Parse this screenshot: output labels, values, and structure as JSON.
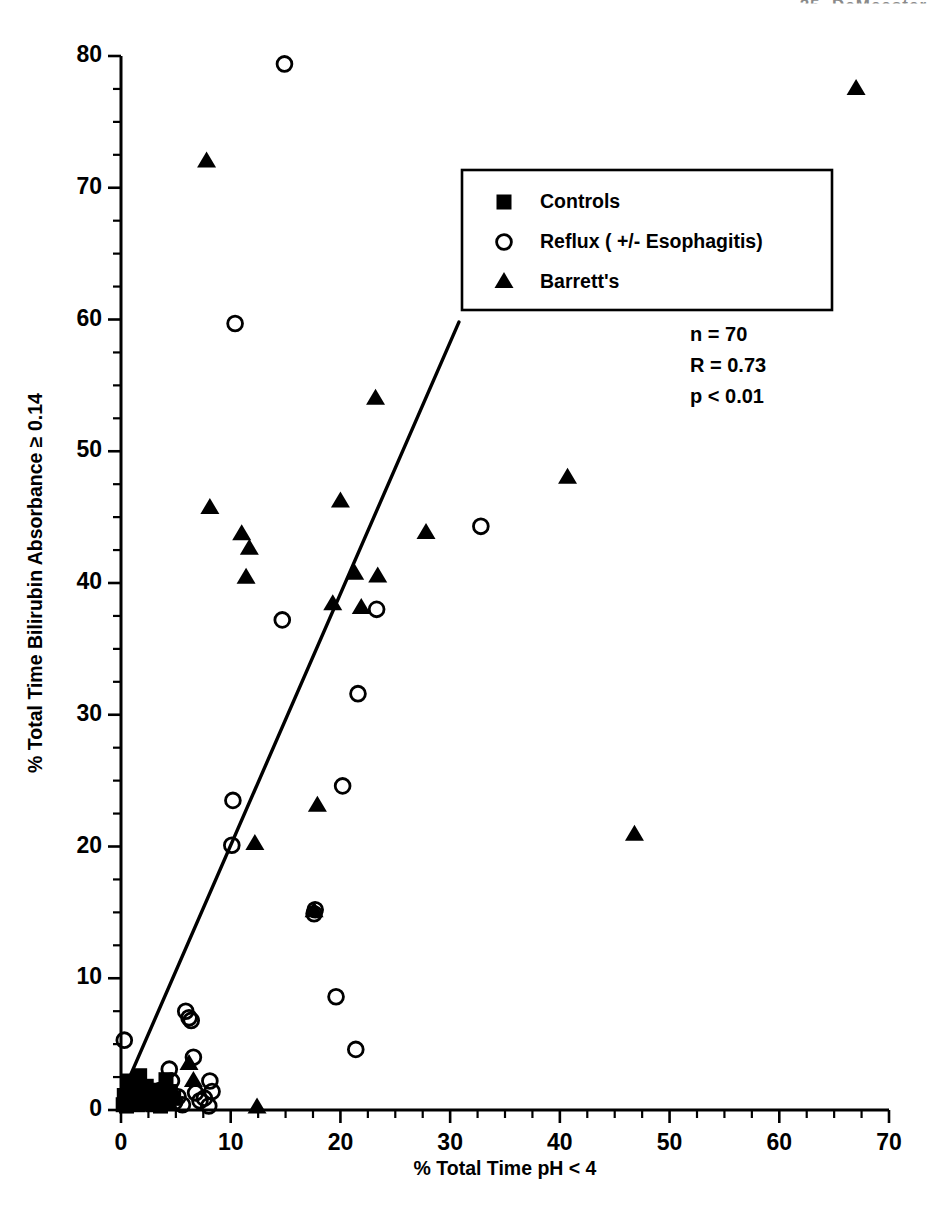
{
  "header": {
    "text": "25. DeMeester"
  },
  "chart_data": {
    "type": "scatter",
    "title": "",
    "xlabel": "% Total Time pH < 4",
    "ylabel": "% Total Time Bilirubin Absorbance ≥ 0.14",
    "xlim": [
      0,
      70
    ],
    "ylim": [
      0,
      80
    ],
    "xticks": [
      0,
      10,
      20,
      30,
      40,
      50,
      60,
      70
    ],
    "yticks": [
      0,
      10,
      20,
      30,
      40,
      50,
      60,
      70,
      80
    ],
    "x_minor_step": 2.5,
    "y_minor_step": 2.5,
    "grid": false,
    "legend_position": "top-center-right",
    "annotations": {
      "n": "n = 70",
      "r": "R = 0.73",
      "p": "p < 0.01"
    },
    "regression_line": {
      "x0": 0.0,
      "y0": 1.0,
      "x1": 30.8,
      "y1": 59.8
    },
    "series": [
      {
        "name": "Controls",
        "marker": "square",
        "points": [
          [
            0.2,
            0.4
          ],
          [
            0.3,
            1.1
          ],
          [
            0.5,
            0.3
          ],
          [
            0.6,
            2.2
          ],
          [
            0.8,
            1.3
          ],
          [
            0.9,
            0.5
          ],
          [
            1.1,
            2.0
          ],
          [
            1.2,
            0.8
          ],
          [
            1.4,
            1.6
          ],
          [
            1.5,
            0.4
          ],
          [
            1.7,
            2.6
          ],
          [
            1.9,
            1.0
          ],
          [
            2.1,
            0.5
          ],
          [
            2.3,
            1.8
          ],
          [
            2.5,
            0.7
          ],
          [
            2.7,
            1.2
          ],
          [
            2.9,
            0.4
          ],
          [
            3.2,
            1.5
          ],
          [
            3.4,
            0.8
          ],
          [
            3.6,
            0.3
          ],
          [
            3.9,
            1.1
          ],
          [
            4.1,
            2.3
          ],
          [
            4.3,
            0.6
          ],
          [
            4.5,
            1.4
          ],
          [
            4.8,
            0.9
          ]
        ]
      },
      {
        "name": "Reflux ( +/- Esophagitis)",
        "marker": "circle",
        "points": [
          [
            0.3,
            5.3
          ],
          [
            2.6,
            1.0
          ],
          [
            3.2,
            0.5
          ],
          [
            3.6,
            1.5
          ],
          [
            4.2,
            0.8
          ],
          [
            4.4,
            3.1
          ],
          [
            4.6,
            2.2
          ],
          [
            4.9,
            0.6
          ],
          [
            5.2,
            1.0
          ],
          [
            5.6,
            0.4
          ],
          [
            5.9,
            7.5
          ],
          [
            6.2,
            7.0
          ],
          [
            6.4,
            6.8
          ],
          [
            6.6,
            4.0
          ],
          [
            6.8,
            1.3
          ],
          [
            7.2,
            0.7
          ],
          [
            7.6,
            0.9
          ],
          [
            8.0,
            0.3
          ],
          [
            8.1,
            2.2
          ],
          [
            8.3,
            1.4
          ],
          [
            10.1,
            20.1
          ],
          [
            10.2,
            23.5
          ],
          [
            10.4,
            59.7
          ],
          [
            14.9,
            79.4
          ],
          [
            14.7,
            37.2
          ],
          [
            17.6,
            14.9
          ],
          [
            17.7,
            15.2
          ],
          [
            19.6,
            8.6
          ],
          [
            20.2,
            24.6
          ],
          [
            21.4,
            4.6
          ],
          [
            21.6,
            31.6
          ],
          [
            23.3,
            38.0
          ],
          [
            32.8,
            44.3
          ]
        ]
      },
      {
        "name": "Barrett's",
        "marker": "triangle",
        "points": [
          [
            6.2,
            3.5
          ],
          [
            6.6,
            2.2
          ],
          [
            7.8,
            72.0
          ],
          [
            8.1,
            45.7
          ],
          [
            11.0,
            43.7
          ],
          [
            11.7,
            42.6
          ],
          [
            11.4,
            40.4
          ],
          [
            12.2,
            20.2
          ],
          [
            12.4,
            0.2
          ],
          [
            17.6,
            15.1
          ],
          [
            17.9,
            23.1
          ],
          [
            19.3,
            38.4
          ],
          [
            20.0,
            46.2
          ],
          [
            21.3,
            40.7
          ],
          [
            21.9,
            38.1
          ],
          [
            23.2,
            54.0
          ],
          [
            23.4,
            40.5
          ],
          [
            27.8,
            43.8
          ],
          [
            40.7,
            48.0
          ],
          [
            46.8,
            20.9
          ],
          [
            67.0,
            77.5
          ]
        ]
      }
    ]
  }
}
